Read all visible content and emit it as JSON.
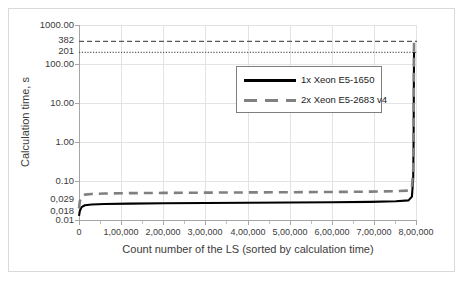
{
  "chart_data": {
    "type": "line",
    "title": "",
    "xlabel": "Count number of the LS (sorted by calculation time)",
    "ylabel": "Calculation time, s",
    "yscale": "log",
    "ylim": [
      0.01,
      1000.0
    ],
    "xlim": [
      0,
      800000
    ],
    "grid": true,
    "legend_position": "inside-upper-center",
    "y_ticks": [
      "1000.00",
      "382",
      "201",
      "100.00",
      "10.00",
      "1.00",
      "0.10",
      "0,029",
      "0,018",
      "0.01"
    ],
    "y_tick_values": [
      1000.0,
      382,
      201,
      100.0,
      10.0,
      1.0,
      0.1,
      0.029,
      0.018,
      0.01
    ],
    "x_ticks": [
      "0",
      "1,00,000",
      "2,00,000",
      "3,00,000",
      "4,00,000",
      "5,00,000",
      "6,00,000",
      "7,00,000",
      "8,00,000"
    ],
    "x_tick_values": [
      0,
      100000,
      200000,
      300000,
      400000,
      500000,
      600000,
      700000,
      800000
    ],
    "series": [
      {
        "name": "1x Xeon E5-1650",
        "style": "solid",
        "color": "#000000",
        "x": [
          0,
          2000,
          6000,
          14000,
          30000,
          60000,
          120000,
          200000,
          300000,
          400000,
          500000,
          600000,
          690000,
          750000,
          780000,
          788000,
          791000,
          792000,
          792500,
          793000
        ],
        "y": [
          0.0135,
          0.018,
          0.0225,
          0.0252,
          0.0264,
          0.0272,
          0.0278,
          0.0283,
          0.0288,
          0.0292,
          0.0296,
          0.0301,
          0.0308,
          0.0318,
          0.0335,
          0.042,
          0.12,
          1.2,
          25,
          201
        ]
      },
      {
        "name": "2x Xeon E5-2683 v4",
        "style": "dashed",
        "color": "#808080",
        "x": [
          0,
          2000,
          6000,
          14000,
          30000,
          60000,
          120000,
          200000,
          300000,
          400000,
          500000,
          600000,
          690000,
          750000,
          780000,
          788000,
          791000,
          792000,
          792500,
          793000
        ],
        "y": [
          0.021,
          0.032,
          0.042,
          0.047,
          0.049,
          0.0503,
          0.0513,
          0.0521,
          0.0529,
          0.0536,
          0.0543,
          0.0551,
          0.0561,
          0.0575,
          0.0598,
          0.072,
          0.2,
          2.0,
          40,
          382
        ]
      }
    ],
    "reference_lines": [
      {
        "value": 382,
        "label": "382",
        "style": "dashed",
        "color": "#595959"
      },
      {
        "value": 201,
        "label": "201",
        "style": "dotted",
        "color": "#595959"
      }
    ]
  },
  "legend": {
    "items": [
      {
        "label": "1x Xeon E5-1650",
        "style": "solid",
        "color": "#000000"
      },
      {
        "label": "2x Xeon E5-2683 v4",
        "style": "dashed",
        "color": "#808080"
      }
    ]
  },
  "axes": {
    "x_title": "Count number of the LS (sorted by calculation time)",
    "y_title": "Calculation time, s",
    "y_tick_labels": [
      "1000.00",
      "382",
      "201",
      "100.00",
      "10.00",
      "1.00",
      "0.10",
      "0,029",
      "0,018",
      "0.01"
    ],
    "x_tick_labels": [
      "0",
      "1,00,000",
      "2,00,000",
      "3,00,000",
      "4,00,000",
      "5,00,000",
      "6,00,000",
      "7,00,000",
      "8,00,000"
    ]
  },
  "colors": {
    "series1": "#000000",
    "series2": "#808080",
    "grid": "#e3e3e3",
    "axis": "#a6a6a6",
    "frame": "#d9d9d9",
    "text": "#3b3b3b"
  }
}
